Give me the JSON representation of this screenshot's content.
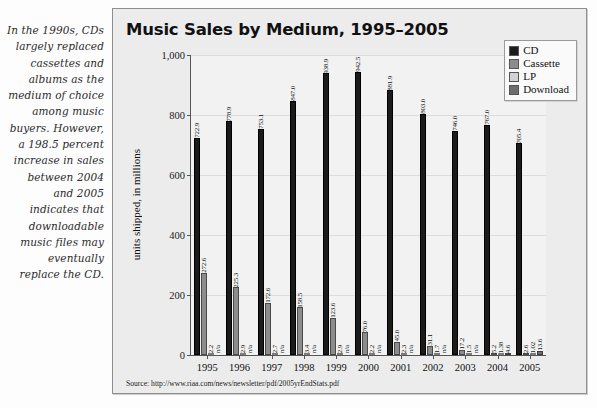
{
  "caption": "In the 1990s, CDs largely replaced cassettes and albums as the medium of choice among music buyers. However, a 198.5 percent increase in sales between 2004 and 2005 indicates that downloadable music files may eventually replace the CD.",
  "source": "Source: http://www.riaa.com/news/newsletter/pdf/2005yrEndStats.pdf",
  "legend": {
    "items": [
      {
        "label": "CD",
        "color": "#1b1b1b"
      },
      {
        "label": "Cassette",
        "color": "#8c8c8c"
      },
      {
        "label": "LP",
        "color": "#d2d2d2"
      },
      {
        "label": "Download",
        "color": "#6e6e6e"
      }
    ]
  },
  "chart_data": {
    "type": "bar",
    "title": "Music Sales by Medium, 1995–2005",
    "xlabel": "",
    "ylabel": "units shipped, in millions",
    "ylim": [
      0,
      1000
    ],
    "yticks": [
      0,
      200,
      400,
      600,
      800,
      1000
    ],
    "ytick_labels": [
      "0",
      "200",
      "400",
      "600",
      "800",
      "1,000"
    ],
    "grid": false,
    "legend_position": "top-right",
    "categories": [
      "1995",
      "1996",
      "1997",
      "1998",
      "1999",
      "2000",
      "2001",
      "2002",
      "2003",
      "2004",
      "2005"
    ],
    "series": [
      {
        "name": "CD",
        "color": "#1b1b1b",
        "values": [
          722.9,
          778.9,
          753.1,
          847.0,
          938.9,
          942.5,
          881.9,
          803.0,
          746.0,
          767.0,
          705.4
        ],
        "labels": [
          "722.9",
          "778.9",
          "753.1",
          "847.0",
          "938.9",
          "942.5",
          "881.9",
          "803.0",
          "746.0",
          "767.0",
          "705.4"
        ]
      },
      {
        "name": "Cassette",
        "color": "#8c8c8c",
        "values": [
          272.6,
          225.3,
          172.6,
          158.5,
          123.6,
          76.0,
          45.0,
          31.1,
          17.2,
          5.2,
          2.6
        ],
        "labels": [
          "272.6",
          "225.3",
          "172.6",
          "158.5",
          "123.6",
          "76.0",
          "45.0",
          "31.1",
          "17.2",
          "5.2",
          "2.6"
        ]
      },
      {
        "name": "LP",
        "color": "#d2d2d2",
        "values": [
          2.2,
          2.9,
          2.7,
          3.4,
          2.9,
          2.2,
          2.3,
          1.7,
          1.5,
          1.38,
          1.02
        ],
        "labels": [
          "2.2",
          "2.9",
          "2.7",
          "3.4",
          "2.9",
          "2.2",
          "2.3",
          "1.7",
          "1.5",
          "1.38",
          "1.02"
        ]
      },
      {
        "name": "Download",
        "color": "#6e6e6e",
        "values": [
          0,
          0,
          0,
          0,
          0,
          0,
          0,
          0,
          0,
          4.6,
          13.6
        ],
        "labels": [
          "n/a",
          "n/a",
          "n/a",
          "n/a",
          "n/a",
          "n/a",
          "n/a",
          "n/a",
          "n/a",
          "4.6",
          "13.6"
        ]
      }
    ]
  }
}
